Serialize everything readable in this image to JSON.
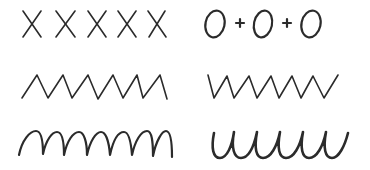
{
  "worksheet": {
    "type": "handwriting-pattern-practice",
    "background": "#ffffff",
    "ink_color": "#2b2b2b",
    "rows": [
      {
        "row": 1,
        "left": {
          "pattern": "x-marks",
          "label": "X X X X X",
          "count": 5
        },
        "right": {
          "pattern": "circles-with-plus",
          "label": "O + O + O",
          "circles": 3,
          "plus_signs": 2
        }
      },
      {
        "row": 2,
        "left": {
          "pattern": "zigzag-up-start",
          "label": "pointed m-zigzag",
          "peaks": 6
        },
        "right": {
          "pattern": "zigzag-down-start",
          "label": "pointed w-zigzag",
          "troughs": 6
        }
      },
      {
        "row": 3,
        "left": {
          "pattern": "arches",
          "label": "rounded m-arches",
          "arches": 7
        },
        "right": {
          "pattern": "cups",
          "label": "rounded u-cups",
          "cups": 6
        }
      }
    ]
  }
}
